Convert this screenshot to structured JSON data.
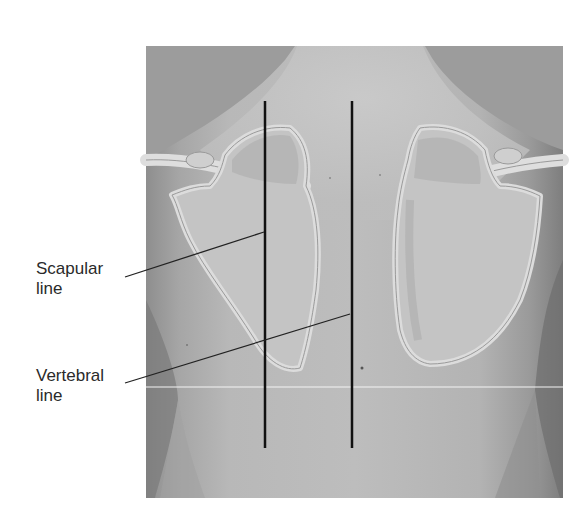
{
  "figure": {
    "labels": {
      "scapular": {
        "line1": "Scapular",
        "line2": "line"
      },
      "vertebral": {
        "line1": "Vertebral",
        "line2": "line"
      }
    },
    "colors": {
      "background": "#ffffff",
      "panel_dark": "#9a9a9a",
      "skin": "#b9b9b9",
      "skin_light": "#c6c6c6",
      "bone_outline": "#dcdcdc",
      "bone_fill": "#c2c2c2",
      "guide_line": "#111111"
    },
    "structures": [
      "neck",
      "left scapula",
      "right scapula",
      "left clavicle",
      "right clavicle",
      "back",
      "spine"
    ]
  }
}
